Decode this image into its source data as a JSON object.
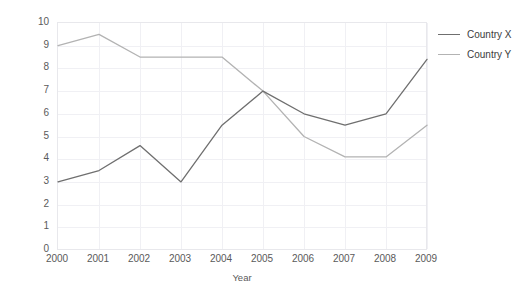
{
  "chart_data": {
    "type": "line",
    "title": "",
    "xlabel": "Year",
    "ylabel": "Percent",
    "categories": [
      "2000",
      "2001",
      "2002",
      "2003",
      "2004",
      "2005",
      "2006",
      "2007",
      "2008",
      "2009"
    ],
    "x": [
      2000,
      2001,
      2002,
      2003,
      2004,
      2005,
      2006,
      2007,
      2008,
      2009
    ],
    "ylim": [
      0,
      10
    ],
    "xlim": [
      2000,
      2009
    ],
    "yticks": [
      "10",
      "9",
      "8",
      "7",
      "6",
      "5",
      "4",
      "3",
      "2",
      "1",
      "0"
    ],
    "ytick_values": [
      10,
      9,
      8,
      7,
      6,
      5,
      4,
      3,
      2,
      1,
      0
    ],
    "grid": true,
    "legend_position": "right",
    "series": [
      {
        "name": "Country X",
        "color": "#6f6f6f",
        "values": [
          3.0,
          3.5,
          4.6,
          3.0,
          5.5,
          7.0,
          6.0,
          5.5,
          6.0,
          8.4
        ]
      },
      {
        "name": "Country Y",
        "color": "#b3b3b3",
        "values": [
          9.0,
          9.5,
          8.5,
          8.5,
          8.5,
          7.0,
          5.0,
          4.1,
          4.1,
          5.5
        ]
      }
    ]
  },
  "legend": {
    "entries": [
      {
        "label": "Country X"
      },
      {
        "label": "Country Y"
      }
    ]
  },
  "colors": {
    "series_x": "#6f6f6f",
    "series_y": "#b3b3b3",
    "grid": "#f0f0f4",
    "frame": "#e8e8ec",
    "tick_text": "#5a5a5a"
  }
}
